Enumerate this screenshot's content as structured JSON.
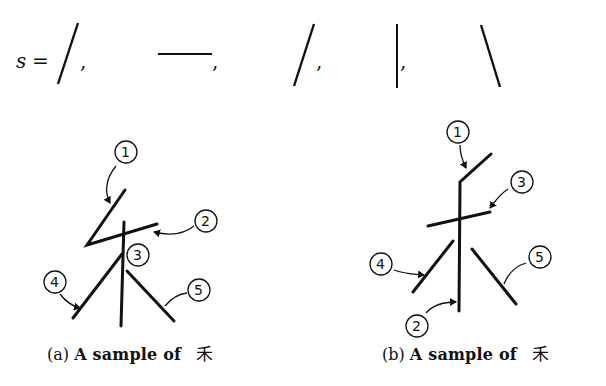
{
  "figure": {
    "stroke_sequence": {
      "variable": "s",
      "equals": "=",
      "separator": ",",
      "strokes": [
        "slash",
        "horizontal",
        "slash",
        "vertical",
        "backslash"
      ]
    },
    "panels": [
      {
        "id": "a",
        "caption_label": "(a)",
        "caption_text": "A sample of",
        "character": "禾",
        "stroke_labels": [
          "1",
          "2",
          "3",
          "4",
          "5"
        ]
      },
      {
        "id": "b",
        "caption_label": "(b)",
        "caption_text": "A sample of",
        "character": "禾",
        "stroke_labels": [
          "1",
          "2",
          "3",
          "4",
          "5"
        ]
      }
    ]
  }
}
